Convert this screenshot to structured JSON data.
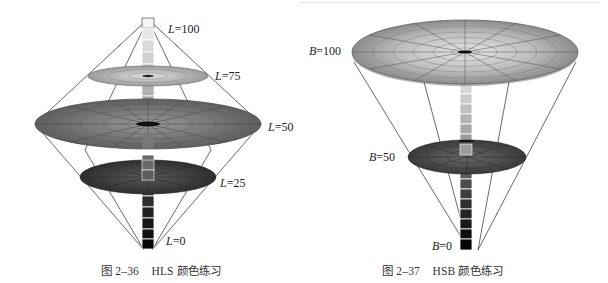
{
  "figures": {
    "hls": {
      "caption_num": "图 2–36",
      "caption_text": "HLS 颜色练习",
      "labels": [
        {
          "var": "L",
          "eq": "=100"
        },
        {
          "var": "L",
          "eq": "=75"
        },
        {
          "var": "L",
          "eq": "=50"
        },
        {
          "var": "L",
          "eq": "=25"
        },
        {
          "var": "L",
          "eq": "=0"
        }
      ]
    },
    "hsb": {
      "caption_num": "图 2–37",
      "caption_text": "HSB 颜色练习",
      "labels": [
        {
          "var": "B",
          "eq": "=100"
        },
        {
          "var": "B",
          "eq": "=50"
        },
        {
          "var": "B",
          "eq": "=0"
        }
      ]
    }
  },
  "colors": {
    "line": "#444444",
    "disk_light": "#a8a8a8",
    "disk_mid": "#6e6e6e",
    "disk_dark": "#3a3a3a"
  }
}
